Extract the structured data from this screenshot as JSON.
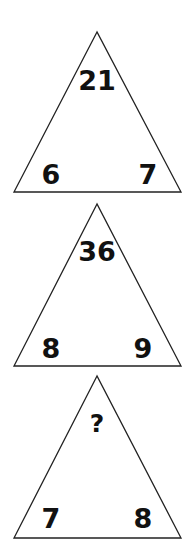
{
  "puzzle": {
    "triangles": [
      {
        "top": "21",
        "left": "6",
        "right": "7"
      },
      {
        "top": "36",
        "left": "8",
        "right": "9"
      },
      {
        "top": "?",
        "left": "7",
        "right": "8"
      }
    ]
  },
  "colors": {
    "stroke": "#222222",
    "text": "#111111",
    "background": "#ffffff"
  }
}
